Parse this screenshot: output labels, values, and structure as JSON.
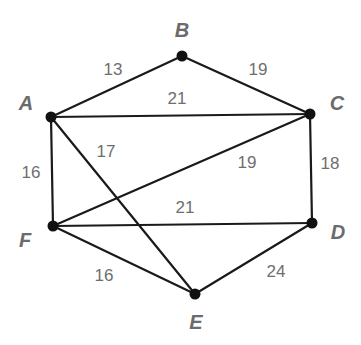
{
  "diagram": {
    "type": "weighted-undirected-graph",
    "colors": {
      "edge": "#1a1a1a",
      "node": "#111111",
      "vertex_label": "#6b6b6b",
      "weight_label": "#6e6e6e",
      "background": "#ffffff"
    },
    "nodes": [
      {
        "id": "A",
        "label": "A",
        "x": 51,
        "y": 117,
        "lx": 26,
        "ly": 110
      },
      {
        "id": "B",
        "label": "B",
        "x": 182,
        "y": 56,
        "lx": 182,
        "ly": 37
      },
      {
        "id": "C",
        "label": "C",
        "x": 310,
        "y": 114,
        "lx": 337,
        "ly": 110
      },
      {
        "id": "D",
        "label": "D",
        "x": 312,
        "y": 223,
        "lx": 338,
        "ly": 239
      },
      {
        "id": "E",
        "label": "E",
        "x": 195,
        "y": 294,
        "lx": 196,
        "ly": 329
      },
      {
        "id": "F",
        "label": "F",
        "x": 53,
        "y": 226,
        "lx": 25,
        "ly": 247
      }
    ],
    "edges": [
      {
        "from": "A",
        "to": "B",
        "weight": "13",
        "lx": 113,
        "ly": 75
      },
      {
        "from": "B",
        "to": "C",
        "weight": "19",
        "lx": 258,
        "ly": 75
      },
      {
        "from": "A",
        "to": "C",
        "weight": "21",
        "lx": 177,
        "ly": 104
      },
      {
        "from": "A",
        "to": "F",
        "weight": "16",
        "lx": 31,
        "ly": 178
      },
      {
        "from": "A",
        "to": "E",
        "weight": "17",
        "lx": 106,
        "ly": 157
      },
      {
        "from": "F",
        "to": "C",
        "weight": "19",
        "lx": 247,
        "ly": 168
      },
      {
        "from": "C",
        "to": "D",
        "weight": "18",
        "lx": 330,
        "ly": 169
      },
      {
        "from": "F",
        "to": "D",
        "weight": "21",
        "lx": 185,
        "ly": 213
      },
      {
        "from": "F",
        "to": "E",
        "weight": "16",
        "lx": 104,
        "ly": 281
      },
      {
        "from": "E",
        "to": "D",
        "weight": "24",
        "lx": 276,
        "ly": 277
      }
    ]
  }
}
